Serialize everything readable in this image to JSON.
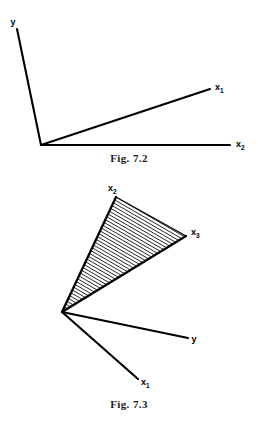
{
  "document": {
    "background_color": "#ffffff",
    "ink_color": "#000000"
  },
  "figures": [
    {
      "id": "fig-7-2",
      "caption": "Fig. 7.2",
      "kind": "vector-ray-diagram",
      "description": "Three rays emanating from a common origin vertex",
      "origin": {
        "x": 41,
        "y": 145
      },
      "rays": [
        {
          "name": "y",
          "label": "y",
          "subscript": "",
          "tip": {
            "x": 17,
            "y": 29
          },
          "label_pos": {
            "x": 13,
            "y": 25
          }
        },
        {
          "name": "x1",
          "label": "x",
          "subscript": "1",
          "tip": {
            "x": 210,
            "y": 89
          },
          "label_pos": {
            "x": 215,
            "y": 90
          }
        },
        {
          "name": "x2",
          "label": "x",
          "subscript": "2",
          "tip": {
            "x": 230,
            "y": 145
          },
          "label_pos": {
            "x": 236,
            "y": 147
          }
        }
      ]
    },
    {
      "id": "fig-7-3",
      "caption": "Fig. 7.3",
      "kind": "vector-cone-diagram",
      "description": "Hatched convex cone spanned by x2 and x3, with rays y and x1 outside the cone",
      "origin": {
        "x": 62,
        "y": 140
      },
      "cone": {
        "hatched": true,
        "hatch_angle_deg": 30,
        "hatch_spacing_px": 3.1,
        "edges": [
          "x2",
          "x3"
        ]
      },
      "rays": [
        {
          "name": "x2",
          "label": "x",
          "subscript": "2",
          "tip": {
            "x": 116,
            "y": 25
          },
          "label_pos": {
            "x": 112,
            "y": 19
          },
          "in_cone_edge": true
        },
        {
          "name": "x3",
          "label": "x",
          "subscript": "3",
          "tip": {
            "x": 186,
            "y": 64
          },
          "label_pos": {
            "x": 191,
            "y": 63
          },
          "in_cone_edge": true
        },
        {
          "name": "y",
          "label": "y",
          "subscript": "",
          "tip": {
            "x": 188,
            "y": 166
          },
          "label_pos": {
            "x": 193,
            "y": 169
          },
          "in_cone_edge": false
        },
        {
          "name": "x1",
          "label": "x",
          "subscript": "1",
          "tip": {
            "x": 138,
            "y": 207
          },
          "label_pos": {
            "x": 141,
            "y": 212
          },
          "in_cone_edge": false
        }
      ]
    }
  ]
}
